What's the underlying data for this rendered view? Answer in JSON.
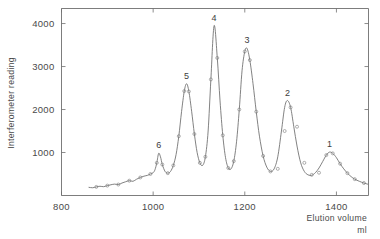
{
  "chart_data": {
    "type": "line",
    "title": "",
    "xlabel": "Elution volume",
    "xlabel_unit": "ml",
    "ylabel": "Interferometer reading",
    "xlim": [
      800,
      1470
    ],
    "ylim": [
      0,
      4350
    ],
    "xticks": [
      800,
      1000,
      1200,
      1400
    ],
    "xtick_labels": [
      "800",
      "1000",
      "1200",
      "1400"
    ],
    "yticks": [
      1000,
      2000,
      3000,
      4000
    ],
    "ytick_labels": [
      "1000",
      "2000",
      "3000",
      "4000"
    ],
    "grid": false,
    "legend": "none",
    "line_color": "#6b6b6b",
    "marker_style": "open-circle",
    "annotations": [
      {
        "label": "6",
        "x": 1012,
        "y": 1000
      },
      {
        "label": "5",
        "x": 1073,
        "y": 2600
      },
      {
        "label": "4",
        "x": 1133,
        "y": 3950
      },
      {
        "label": "3",
        "x": 1205,
        "y": 3420
      },
      {
        "label": "2",
        "x": 1293,
        "y": 2210
      },
      {
        "label": "1",
        "x": 1385,
        "y": 1010
      }
    ],
    "series": [
      {
        "name": "Interferometer reading",
        "x": [
          860,
          868,
          876,
          884,
          892,
          900,
          908,
          916,
          924,
          932,
          940,
          948,
          956,
          964,
          972,
          980,
          988,
          994,
          1000,
          1004,
          1008,
          1012,
          1016,
          1020,
          1026,
          1032,
          1038,
          1044,
          1050,
          1056,
          1062,
          1068,
          1073,
          1078,
          1084,
          1090,
          1096,
          1102,
          1108,
          1114,
          1120,
          1126,
          1133,
          1140,
          1146,
          1152,
          1158,
          1164,
          1170,
          1176,
          1182,
          1188,
          1194,
          1200,
          1205,
          1211,
          1218,
          1225,
          1232,
          1240,
          1248,
          1256,
          1264,
          1272,
          1280,
          1287,
          1293,
          1300,
          1307,
          1314,
          1322,
          1330,
          1338,
          1346,
          1354,
          1362,
          1370,
          1378,
          1385,
          1392,
          1400,
          1408,
          1416,
          1424,
          1432,
          1440,
          1450,
          1460,
          1468
        ],
        "y": [
          190,
          180,
          200,
          215,
          205,
          230,
          250,
          265,
          255,
          290,
          320,
          345,
          330,
          380,
          420,
          450,
          470,
          500,
          530,
          600,
          760,
          980,
          900,
          720,
          560,
          520,
          560,
          700,
          950,
          1380,
          1950,
          2430,
          2600,
          2420,
          1960,
          1430,
          1000,
          760,
          700,
          900,
          1500,
          2700,
          3950,
          3200,
          2200,
          1400,
          880,
          640,
          620,
          800,
          1250,
          2000,
          2900,
          3350,
          3420,
          3150,
          2600,
          1950,
          1380,
          920,
          660,
          560,
          620,
          900,
          1500,
          2050,
          2210,
          2050,
          1600,
          1150,
          760,
          560,
          480,
          470,
          530,
          640,
          790,
          940,
          1010,
          980,
          880,
          740,
          620,
          520,
          440,
          380,
          330,
          290,
          265
        ]
      }
    ],
    "marker_points": {
      "x": [
        876,
        900,
        924,
        948,
        972,
        994,
        1008,
        1020,
        1032,
        1044,
        1056,
        1068,
        1078,
        1090,
        1102,
        1114,
        1126,
        1140,
        1152,
        1164,
        1176,
        1188,
        1200,
        1211,
        1225,
        1240,
        1256,
        1272,
        1287,
        1300,
        1314,
        1330,
        1346,
        1362,
        1378,
        1392,
        1408,
        1424,
        1440,
        1460
      ],
      "y": [
        200,
        230,
        255,
        345,
        420,
        500,
        760,
        720,
        520,
        700,
        1380,
        2430,
        2420,
        1430,
        760,
        900,
        2700,
        3200,
        1400,
        640,
        800,
        2000,
        3350,
        3150,
        1950,
        920,
        560,
        620,
        1500,
        2050,
        1600,
        760,
        480,
        530,
        940,
        980,
        740,
        520,
        380,
        290
      ]
    }
  },
  "axis": {
    "y_title": "Interferometer reading",
    "x_title": "Elution volume",
    "x_unit": "ml"
  }
}
